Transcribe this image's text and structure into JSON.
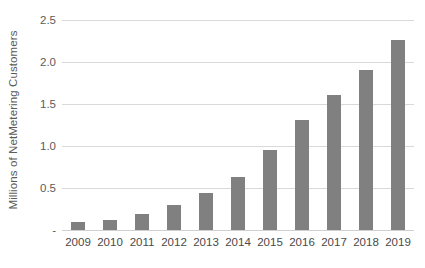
{
  "chart_data": {
    "type": "bar",
    "title": "",
    "subtitle": "",
    "xlabel": "",
    "ylabel": "Millions of NetMetering Customers",
    "categories": [
      "2009",
      "2010",
      "2011",
      "2012",
      "2013",
      "2014",
      "2015",
      "2016",
      "2017",
      "2018",
      "2019"
    ],
    "values": [
      0.1,
      0.12,
      0.19,
      0.3,
      0.44,
      0.63,
      0.95,
      1.31,
      1.61,
      1.91,
      2.26
    ],
    "ylim": [
      0,
      2.5
    ],
    "ytick_values": [
      0,
      0.5,
      1.0,
      1.5,
      2.0,
      2.5
    ],
    "ytick_labels": [
      "-",
      "0.5",
      "1.0",
      "1.5",
      "2.0",
      "2.5"
    ],
    "grid": true,
    "legend": false,
    "legend_position": "none",
    "series": [
      {
        "name": "Net Metering Customers",
        "values": [
          0.1,
          0.12,
          0.19,
          0.3,
          0.44,
          0.63,
          0.95,
          1.31,
          1.61,
          1.91,
          2.26
        ]
      }
    ],
    "colors": {
      "bar": "#808080",
      "gridline": "#d9d9d9",
      "baseline": "#cfcfcf",
      "tick_label": "#4a4a4a",
      "axis_title": "#5b5b5b",
      "background": "#ffffff"
    }
  }
}
